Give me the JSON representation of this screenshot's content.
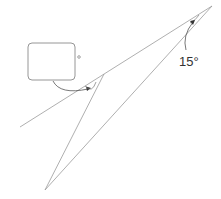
{
  "diagram": {
    "angle_label": "15°",
    "answer_box": "",
    "degree_mark": "°",
    "colors": {
      "line": "#9a9a9a",
      "text": "#333333",
      "box": "#8a8a8a"
    }
  }
}
